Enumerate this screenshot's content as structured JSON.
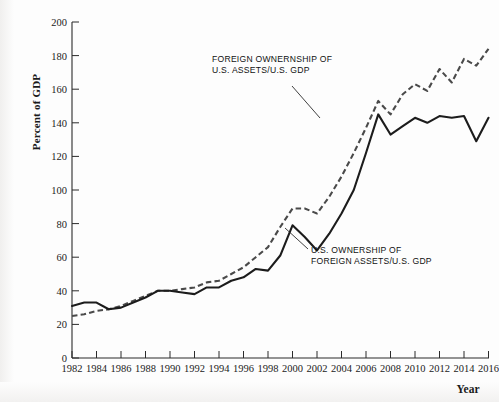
{
  "chart_data": {
    "type": "line",
    "title": "",
    "subtitle": "",
    "xlabel": "Year",
    "ylabel": "Percent of GDP",
    "xlim": [
      1982,
      2016
    ],
    "ylim": [
      0,
      200
    ],
    "ytick_step": 20,
    "xtick_step": 2,
    "grid": false,
    "legend_position": "inline-annotation",
    "y_ticks": [
      0,
      20,
      40,
      60,
      80,
      100,
      120,
      140,
      160,
      180,
      200
    ],
    "x_ticks": [
      1982,
      1984,
      1986,
      1988,
      1990,
      1992,
      1994,
      1996,
      1998,
      2000,
      2002,
      2004,
      2006,
      2008,
      2010,
      2012,
      2014,
      2016
    ],
    "x": [
      1982,
      1983,
      1984,
      1985,
      1986,
      1987,
      1988,
      1989,
      1990,
      1991,
      1992,
      1993,
      1994,
      1995,
      1996,
      1997,
      1998,
      1999,
      2000,
      2001,
      2002,
      2003,
      2004,
      2005,
      2006,
      2007,
      2008,
      2009,
      2010,
      2011,
      2012,
      2013,
      2014,
      2015,
      2016
    ],
    "series": [
      {
        "name": "U.S. OWNERSHIP OF FOREIGN ASSETS/U.S. GDP",
        "style": "solid",
        "color": "#1c1c1c",
        "values": [
          31,
          33,
          33,
          29,
          30,
          33,
          36,
          40,
          40,
          39,
          38,
          42,
          42,
          46,
          48,
          53,
          52,
          61,
          79,
          72,
          64,
          74,
          86,
          100,
          122,
          145,
          133,
          138,
          143,
          140,
          144,
          143,
          144,
          129,
          143
        ]
      },
      {
        "name": "FOREIGN OWNERNSHIP OF U.S. ASSETS/U.S. GDP",
        "style": "dashed",
        "color": "#4a4a4a",
        "values": [
          25,
          26,
          28,
          29,
          31,
          34,
          37,
          40,
          40,
          41,
          42,
          45,
          46,
          50,
          54,
          60,
          66,
          78,
          89,
          89,
          86,
          96,
          108,
          122,
          137,
          153,
          145,
          157,
          163,
          159,
          172,
          164,
          178,
          174,
          184
        ]
      }
    ],
    "annotations": [
      {
        "name": "foreign-ownership-label",
        "text_lines": [
          "FOREIGN OWNERNSHIP OF",
          "U.S. ASSETS/U.S. GDP"
        ],
        "x_px": 212,
        "y_px": 63
      },
      {
        "name": "us-ownership-label",
        "text_lines": [
          "U.S. OWNERSHIP OF",
          "FOREIGN ASSETS/U.S. GDP"
        ],
        "x_px": 310,
        "y_px": 252
      }
    ]
  },
  "axis": {
    "y_title": "Percent of GDP",
    "x_title": "Year",
    "y_tick_labels": [
      "200",
      "180",
      "160",
      "140",
      "120",
      "100",
      "80",
      "60",
      "40",
      "20",
      "0"
    ],
    "x_tick_labels": [
      "1982",
      "1984",
      "1986",
      "1988",
      "1990",
      "1992",
      "1994",
      "1996",
      "1998",
      "2000",
      "2002",
      "2004",
      "2006",
      "2008",
      "2010",
      "2012",
      "2014",
      "2016"
    ]
  },
  "annotation_1": {
    "line1": "FOREIGN OWNERNSHIP OF",
    "line2": "U.S. ASSETS/U.S. GDP"
  },
  "annotation_2": {
    "line1": "U.S. OWNERSHIP OF",
    "line2": "FOREIGN ASSETS/U.S. GDP"
  }
}
